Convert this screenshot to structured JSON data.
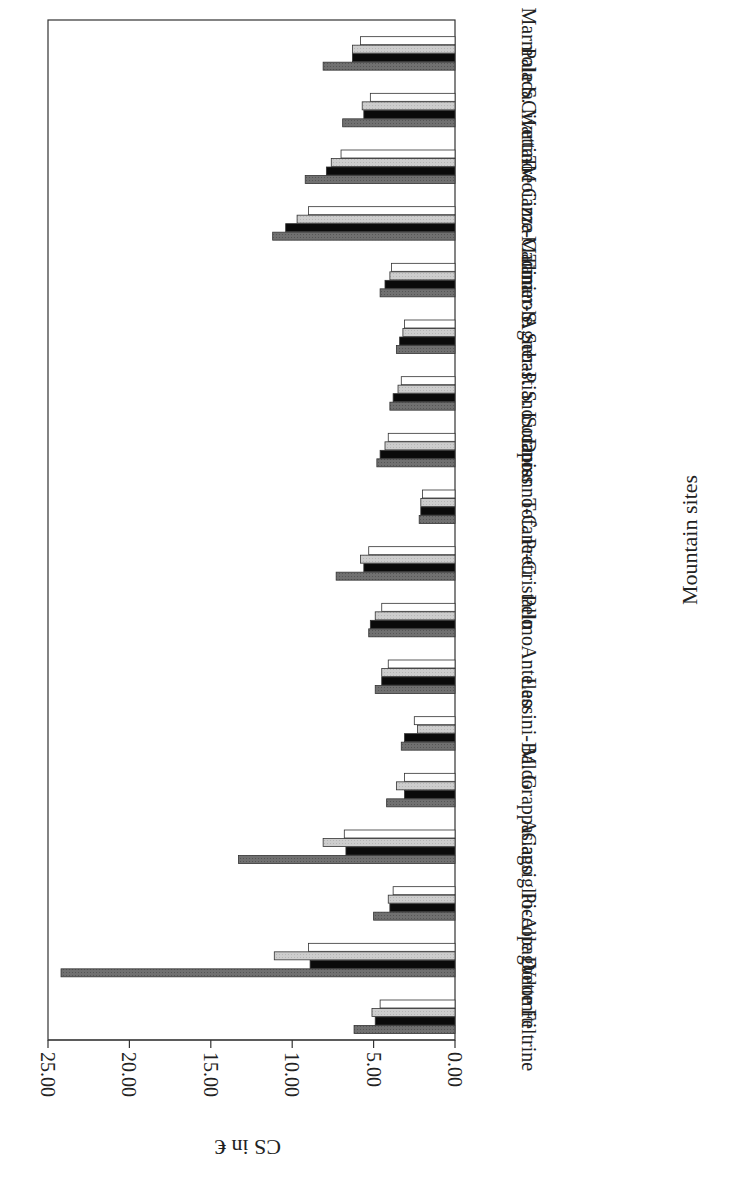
{
  "chart_data": {
    "type": "bar",
    "orientation": "rotated-180-horizontal",
    "title": "",
    "xlabel": "Mountain sites",
    "ylabel": "CS in €",
    "ylim": [
      0,
      25
    ],
    "y_ticks": [
      "0.00",
      "5.00",
      "10.00",
      "15.00",
      "20.00",
      "25.00"
    ],
    "grid": false,
    "legend": null,
    "categories": [
      "Vette Feltrine",
      "Piccole Dolomiti",
      "Cansiglio-Alpago",
      "Asiago",
      "M. Grappa",
      "Lessini-Baldo",
      "Antelao",
      "Pelmo",
      "Tofane-Cristallo",
      "Duranno-C. Preti",
      "Sorapiss",
      "Agner-P. S. Lucano",
      "Tamer-S. Sebastiano",
      "Marmarole",
      "Tre Cime-Cadini",
      "Civetta-Moiazza",
      "Pale S. Martino",
      "Marmolada"
    ],
    "series": [
      {
        "name": "Series 1 (dark gray)",
        "color": "#6e6e6e",
        "values": [
          6.2,
          24.2,
          5.0,
          13.3,
          4.2,
          3.3,
          4.9,
          5.3,
          7.3,
          2.2,
          4.8,
          4.0,
          3.6,
          4.6,
          11.2,
          9.2,
          6.9,
          8.1
        ]
      },
      {
        "name": "Series 2 (black)",
        "color": "#0a0a0a",
        "values": [
          4.9,
          8.9,
          4.0,
          6.7,
          3.1,
          3.1,
          4.5,
          5.2,
          5.6,
          2.1,
          4.6,
          3.8,
          3.4,
          4.3,
          10.4,
          7.9,
          5.6,
          6.3
        ]
      },
      {
        "name": "Series 3 (light gray)",
        "color": "#c8c8c8",
        "values": [
          5.1,
          11.1,
          4.1,
          8.1,
          3.6,
          2.3,
          4.5,
          4.9,
          5.8,
          2.1,
          4.3,
          3.5,
          3.2,
          4.0,
          9.7,
          7.6,
          5.7,
          6.3
        ]
      },
      {
        "name": "Series 4 (white)",
        "color": "#ffffff",
        "values": [
          4.6,
          9.0,
          3.8,
          6.8,
          3.1,
          2.5,
          4.1,
          4.5,
          5.3,
          2.0,
          4.1,
          3.3,
          3.1,
          3.9,
          9.0,
          7.0,
          5.2,
          5.8
        ]
      }
    ]
  }
}
